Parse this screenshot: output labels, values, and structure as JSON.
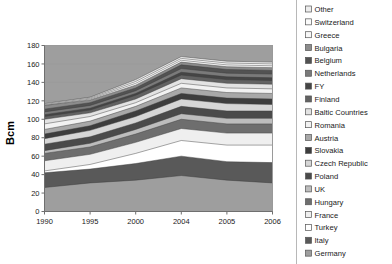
{
  "chart_data": {
    "type": "area",
    "title": "",
    "xlabel": "",
    "ylabel": "Bcm",
    "x": [
      1990,
      1995,
      2000,
      2004,
      2005,
      2006
    ],
    "xtick_labels": [
      "1990",
      "1995",
      "2000",
      "2004",
      "2005",
      "2006"
    ],
    "ytick_labels": [
      "0",
      "20",
      "40",
      "60",
      "80",
      "100",
      "120",
      "140",
      "160",
      "180"
    ],
    "ytick_values": [
      0,
      20,
      40,
      60,
      80,
      100,
      120,
      140,
      160,
      180
    ],
    "ylim": [
      0,
      180
    ],
    "grid": true,
    "legend_position": "right",
    "stacked": true,
    "stack_order_bottom_to_top": [
      "Germany",
      "Italy",
      "Turkey",
      "France",
      "Hungary",
      "UK",
      "Poland",
      "Czech Republic",
      "Slovakia",
      "Austria",
      "Romania",
      "Baltic Countries",
      "Finland",
      "FY",
      "Netherlands",
      "Belgium",
      "Bulgaria",
      "Greece",
      "Switzerland",
      "Other"
    ],
    "series": [
      {
        "name": "Germany",
        "fill": "#9e9e9e",
        "values": [
          26,
          31,
          34,
          39,
          34,
          31
        ]
      },
      {
        "name": "Italy",
        "fill": "#595959",
        "values": [
          16,
          15,
          18,
          21,
          20,
          22
        ]
      },
      {
        "name": "Turkey",
        "fill": "#ffffff",
        "values": [
          2,
          5,
          11,
          17,
          18,
          19
        ]
      },
      {
        "name": "France",
        "fill": "#efefef",
        "values": [
          11,
          11,
          12,
          13,
          13,
          13
        ]
      },
      {
        "name": "Hungary",
        "fill": "#6e6e6e",
        "values": [
          8,
          8,
          9,
          10,
          10,
          10
        ]
      },
      {
        "name": "UK",
        "fill": "#bdbdbd",
        "values": [
          3,
          4,
          5,
          6,
          6,
          6
        ]
      },
      {
        "name": "Poland",
        "fill": "#4a4a4a",
        "values": [
          7,
          7,
          7,
          8,
          8,
          8
        ]
      },
      {
        "name": "Czech Republic",
        "fill": "#d6d6d6",
        "values": [
          6,
          7,
          7,
          8,
          8,
          7
        ]
      },
      {
        "name": "Slovakia",
        "fill": "#3d3d3d",
        "values": [
          5,
          5,
          6,
          6,
          6,
          6
        ]
      },
      {
        "name": "Austria",
        "fill": "#a8a8a8",
        "values": [
          5,
          5,
          5,
          6,
          6,
          6
        ]
      },
      {
        "name": "Romania",
        "fill": "#f2f2f2",
        "values": [
          6,
          5,
          4,
          5,
          5,
          5
        ]
      },
      {
        "name": "Baltic Countries",
        "fill": "#e3e3e3",
        "values": [
          5,
          4,
          4,
          5,
          5,
          5
        ]
      },
      {
        "name": "Finland",
        "fill": "#626262",
        "values": [
          3,
          3,
          4,
          4,
          4,
          4
        ]
      },
      {
        "name": "FY",
        "fill": "#454545",
        "values": [
          2,
          2,
          2,
          3,
          3,
          3
        ]
      },
      {
        "name": "Netherlands",
        "fill": "#7a7a7a",
        "values": [
          3,
          3,
          3,
          4,
          4,
          4
        ]
      },
      {
        "name": "Belgium",
        "fill": "#525252",
        "values": [
          3,
          3,
          3,
          4,
          4,
          4
        ]
      },
      {
        "name": "Bulgaria",
        "fill": "#8c8c8c",
        "values": [
          4,
          3,
          3,
          3,
          3,
          3
        ]
      },
      {
        "name": "Greece",
        "fill": "#f7f7f7",
        "values": [
          0,
          1,
          2,
          2,
          2,
          2
        ]
      },
      {
        "name": "Switzerland",
        "fill": "#fbfbfb",
        "values": [
          1,
          1,
          2,
          2,
          2,
          2
        ]
      },
      {
        "name": "Other",
        "fill": "#ededed",
        "values": [
          1,
          1,
          2,
          2,
          2,
          2
        ]
      }
    ]
  },
  "legend": {
    "items": [
      {
        "label": "Other",
        "swatch": "#ededed"
      },
      {
        "label": "Switzerland",
        "swatch": "#fbfbfb"
      },
      {
        "label": "Greece",
        "swatch": "#f7f7f7"
      },
      {
        "label": "Bulgaria",
        "swatch": "#8c8c8c"
      },
      {
        "label": "Belgium",
        "swatch": "#525252"
      },
      {
        "label": "Netherlands",
        "swatch": "#7a7a7a"
      },
      {
        "label": "FY",
        "swatch": "#454545"
      },
      {
        "label": "Finland",
        "swatch": "#626262"
      },
      {
        "label": "Baltic Countries",
        "swatch": "#e3e3e3"
      },
      {
        "label": "Romania",
        "swatch": "#f2f2f2"
      },
      {
        "label": "Austria",
        "swatch": "#a8a8a8"
      },
      {
        "label": "Slovakia",
        "swatch": "#3d3d3d"
      },
      {
        "label": "Czech Republic",
        "swatch": "#d6d6d6"
      },
      {
        "label": "Poland",
        "swatch": "#4a4a4a"
      },
      {
        "label": "UK",
        "swatch": "#bdbdbd"
      },
      {
        "label": "Hungary",
        "swatch": "#6e6e6e"
      },
      {
        "label": "France",
        "swatch": "#efefef"
      },
      {
        "label": "Turkey",
        "swatch": "#ffffff"
      },
      {
        "label": "Italy",
        "swatch": "#595959"
      },
      {
        "label": "Germany",
        "swatch": "#9e9e9e"
      }
    ]
  },
  "colors": {
    "plot_background": "#9e9e9e",
    "frame": "#9a9a9a",
    "grid": "#9a9a9a",
    "text": "#1a1a1a"
  }
}
